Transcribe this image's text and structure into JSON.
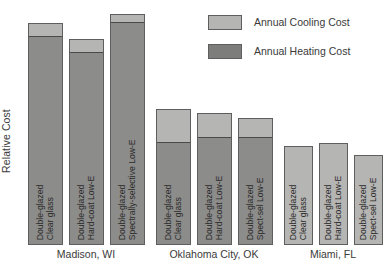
{
  "chart_data": {
    "type": "bar",
    "title": "",
    "subtitle": "",
    "xlabel": "",
    "ylabel": "Relative Cost",
    "stacked": true,
    "grid": false,
    "legend_position": "top-right",
    "ylim": [
      0,
      100
    ],
    "y_ticks_shown": false,
    "colors": {
      "cooling": "#b5b5b3",
      "heating": "#8c8c8a",
      "outline": "#5e5e5e",
      "background": "#ffffff"
    },
    "legend": [
      {
        "key": "cooling",
        "label": "Annual Cooling Cost",
        "color": "#b5b5b3"
      },
      {
        "key": "heating",
        "label": "Annual Heating Cost",
        "color": "#7d7d7b"
      }
    ],
    "series": [
      {
        "name": "Annual Cooling Cost",
        "key": "cooling"
      },
      {
        "name": "Annual Heating Cost",
        "key": "heating"
      }
    ],
    "groups": [
      {
        "name": "Madison, WI",
        "bars": [
          {
            "label_line1": "Double-glazed",
            "label_line2": "Clear glass",
            "cooling": 5,
            "heating": 91,
            "total": 96
          },
          {
            "label_line1": "Double-glazed",
            "label_line2": "Hard-coat Low-E",
            "cooling": 5,
            "heating": 84,
            "total": 89
          },
          {
            "label_line1": "Double-glazed",
            "label_line2": "Spectrally-selective Low-E",
            "cooling": 3,
            "heating": 97,
            "total": 100
          }
        ]
      },
      {
        "name": "Oklahoma City, OK",
        "bars": [
          {
            "label_line1": "Double-glazed",
            "label_line2": "Clear glass",
            "cooling": 14,
            "heating": 45,
            "total": 59
          },
          {
            "label_line1": "Double-glazed",
            "label_line2": "Hard-coat Low-E",
            "cooling": 10,
            "heating": 47,
            "total": 57
          },
          {
            "label_line1": "Double-glazed",
            "label_line2": "Spect-sel Low-E",
            "cooling": 8,
            "heating": 47,
            "total": 55
          }
        ]
      },
      {
        "name": "Miami, FL",
        "bars": [
          {
            "label_line1": "Double-glazed",
            "label_line2": "Clear glass",
            "cooling": 43,
            "heating": 0,
            "total": 43
          },
          {
            "label_line1": "Double-glazed",
            "label_line2": "Hard-coat Low-E",
            "cooling": 44,
            "heating": 0,
            "total": 44
          },
          {
            "label_line1": "Double-glazed",
            "label_line2": "Spect-sel Low-E",
            "cooling": 39,
            "heating": 0,
            "total": 39
          }
        ]
      }
    ]
  },
  "axis": {
    "y_label": "Relative Cost"
  },
  "geometry": {
    "baseline_y": 245,
    "plot_top_y": 14,
    "bar_width": 35,
    "bar_width_miami": 29,
    "groups_x": [
      [
        28,
        69,
        110
      ],
      [
        156,
        197,
        238
      ],
      [
        284,
        319,
        354
      ]
    ],
    "group_label_centers": [
      86,
      214,
      333
    ]
  }
}
